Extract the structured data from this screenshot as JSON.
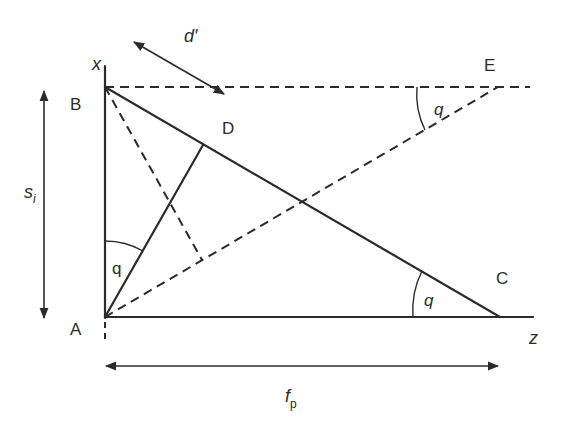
{
  "diagram": {
    "points": {
      "A": "A",
      "B": "B",
      "C": "C",
      "D": "D",
      "E": "E"
    },
    "axes": {
      "x": "x",
      "z": "z"
    },
    "dimensions": {
      "si_main": "s",
      "si_sub": "i",
      "fp_main": "f",
      "fp_sub": "p",
      "d_prime": "d′"
    },
    "angles": {
      "at_A": "q",
      "at_C": "q",
      "at_E": "q"
    },
    "colors": {
      "line": "#2b2b2b",
      "background": "#ffffff"
    }
  }
}
